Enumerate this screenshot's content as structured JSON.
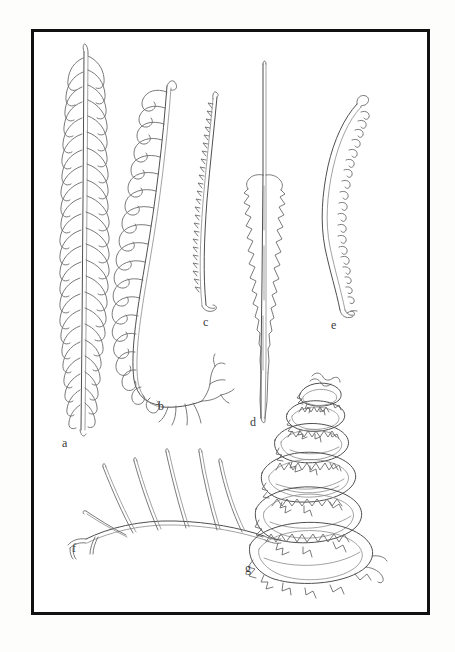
{
  "plate": {
    "title": "Scientific illustration plate of fossil plant fronds",
    "background_color": "#ffffff",
    "border_color": "#111111",
    "ink_color": "#5a5a5a",
    "label_color": "#3b3b3b",
    "border": {
      "x": 31,
      "y": 29,
      "width": 399,
      "height": 586,
      "stroke_width": 3
    }
  },
  "figures": [
    {
      "id": "a",
      "label": "a",
      "label_x": 62,
      "label_y": 437,
      "description": "Slender elongate frond with closely set overlapping curved pinnae along both sides of a straight central axis",
      "form": "bipinnate-narrow-frond"
    },
    {
      "id": "b",
      "label": "b",
      "label_x": 158,
      "label_y": 400,
      "description": "Strongly curved frond with large widely spaced hook-shaped pinnae on the outer margin, branching rootlet structures at the base",
      "form": "curved-frond-with-hooked-pinnae"
    },
    {
      "id": "c",
      "label": "c",
      "label_x": 203,
      "label_y": 316,
      "description": "Narrow gently curved lanceolate leaf with fine serrate teeth along one margin",
      "form": "narrow-serrate-leaf"
    },
    {
      "id": "d",
      "label": "d",
      "label_x": 250,
      "label_y": 416,
      "description": "Long thin stalk expanding into a symmetrical lanceolate blade with coarse jagged teeth on both margins, tapering to a point",
      "form": "stalked-lanceolate-blade"
    },
    {
      "id": "e",
      "label": "e",
      "label_x": 331,
      "label_y": 319,
      "description": "Sigmoid S-curved slender frond bearing small recurved hooked pinnae along the inner margin",
      "form": "sigmoid-frond"
    },
    {
      "id": "f",
      "label": "f",
      "label_x": 72,
      "label_y": 542,
      "description": "Arched rachis bearing five long straight slender pinnae directed obliquely upward",
      "form": "arched-rachis-with-long-pinnae"
    },
    {
      "id": "g",
      "label": "g",
      "label_x": 245,
      "label_y": 562,
      "description": "Helically coiled conical frond, spirally wound in several turns with toothed serrate margins",
      "form": "helical-coiled-frond"
    }
  ]
}
